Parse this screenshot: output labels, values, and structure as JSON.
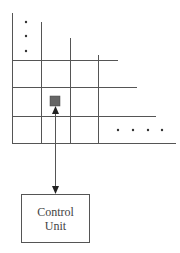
{
  "diagram": {
    "type": "processor-array-with-control-unit",
    "grid": {
      "line_color": "#555555",
      "vertical_lines": [
        {
          "x": 12,
          "y1": 13,
          "y2": 143
        },
        {
          "x": 41,
          "y1": 22,
          "y2": 143
        },
        {
          "x": 70,
          "y1": 38,
          "y2": 143
        },
        {
          "x": 98,
          "y1": 55,
          "y2": 143
        }
      ],
      "horizontal_lines": [
        {
          "y": 60,
          "x1": 12,
          "x2": 118
        },
        {
          "y": 87,
          "x1": 12,
          "x2": 137
        },
        {
          "y": 116,
          "x1": 12,
          "x2": 156
        },
        {
          "y": 143,
          "x1": 12,
          "x2": 176
        }
      ],
      "vertical_ellipsis_dots": [
        {
          "x": 26,
          "y": 22
        },
        {
          "x": 26,
          "y": 36
        },
        {
          "x": 26,
          "y": 51
        }
      ],
      "horizontal_ellipsis_dots": [
        {
          "x": 118,
          "y": 130
        },
        {
          "x": 133,
          "y": 130
        },
        {
          "x": 148,
          "y": 130
        },
        {
          "x": 162,
          "y": 130
        }
      ]
    },
    "processing_element": {
      "x": 50,
      "y": 96,
      "size": 10,
      "fill": "#666666"
    },
    "connection": {
      "x": 55,
      "y1": 106,
      "y2": 194,
      "bidirectional": true
    },
    "control_unit": {
      "line1": "Control",
      "line2": "Unit"
    }
  }
}
